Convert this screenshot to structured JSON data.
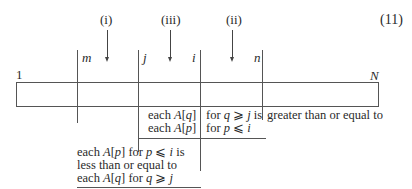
{
  "equation_number": "(11)",
  "array": {
    "start_label": "1",
    "end_label": "N"
  },
  "markers": [
    {
      "label": "m"
    },
    {
      "label": "j"
    },
    {
      "label": "i"
    },
    {
      "label": "n"
    }
  ],
  "arrows": [
    {
      "label": "(i)"
    },
    {
      "label": "(iii)"
    },
    {
      "label": "(ii)"
    }
  ],
  "annotations": {
    "upper_left_col": [
      "each A[q]",
      "each A[p]"
    ],
    "upper_right_col": [
      "for q ⩾ j is",
      "for p ⩽ i"
    ],
    "upper_tail": "greater than or equal to",
    "lower": [
      "each A[p] for p ⩽ i is",
      "less than or equal to",
      "each A[q] for q ⩾ j"
    ]
  }
}
